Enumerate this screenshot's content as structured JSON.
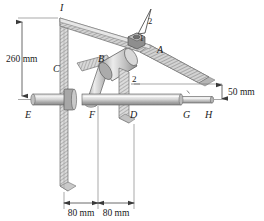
{
  "figure": {
    "background_color": "#ffffff",
    "line_color": "#4a4a4a",
    "text_color": "#1a1a1a",
    "metal_light": "#e2e2e2",
    "metal_mid": "#b8b8b8",
    "metal_dark": "#8f8f8f",
    "hatch_color": "#9a9a9a"
  },
  "part_labels": {
    "top_plate_edge": "I",
    "vertical_plate": "C",
    "inclined_arm": "A",
    "collar": "B",
    "shaft_left_end": "E",
    "shaft_point_f": "F",
    "shaft_point_d": "D",
    "shaft_point_g": "G",
    "shaft_right_end": "H"
  },
  "slope_triangle": {
    "rise_label": "2",
    "run_label": "1"
  },
  "callouts": {
    "point_two": "2"
  },
  "dimensions": {
    "vertical_height": "260 mm",
    "shaft_offset": "50 mm",
    "span_left": "80 mm",
    "span_right": "80 mm"
  },
  "watermark": {
    "text": ""
  }
}
